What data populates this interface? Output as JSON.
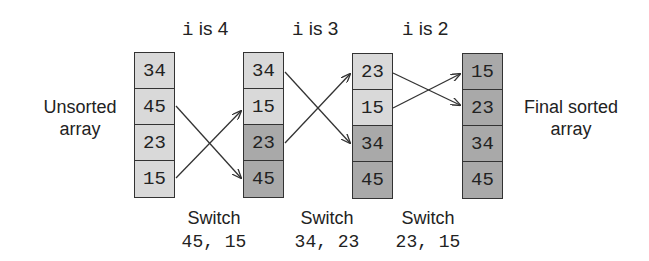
{
  "headers": [
    {
      "var": "i",
      "text": " is 4"
    },
    {
      "var": "i",
      "text": " is 3"
    },
    {
      "var": "i",
      "text": " is 2"
    }
  ],
  "labels": {
    "left_line1": "Unsorted",
    "left_line2": "array",
    "right_line1": "Final sorted",
    "right_line2": "array"
  },
  "columns": [
    {
      "cells": [
        {
          "value": "34",
          "shade": "light"
        },
        {
          "value": "45",
          "shade": "light"
        },
        {
          "value": "23",
          "shade": "light"
        },
        {
          "value": "15",
          "shade": "light"
        }
      ]
    },
    {
      "cells": [
        {
          "value": "34",
          "shade": "light"
        },
        {
          "value": "15",
          "shade": "light"
        },
        {
          "value": "23",
          "shade": "dark"
        },
        {
          "value": "45",
          "shade": "dark"
        }
      ]
    },
    {
      "cells": [
        {
          "value": "23",
          "shade": "light"
        },
        {
          "value": "15",
          "shade": "light"
        },
        {
          "value": "34",
          "shade": "dark"
        },
        {
          "value": "45",
          "shade": "dark"
        }
      ]
    },
    {
      "cells": [
        {
          "value": "15",
          "shade": "dark"
        },
        {
          "value": "23",
          "shade": "dark"
        },
        {
          "value": "34",
          "shade": "dark"
        },
        {
          "value": "45",
          "shade": "dark"
        }
      ]
    }
  ],
  "switches": [
    {
      "label": "Switch",
      "values": "45, 15"
    },
    {
      "label": "Switch",
      "values": "34, 23"
    },
    {
      "label": "Switch",
      "values": "23, 15"
    }
  ],
  "colors": {
    "light_cell": "#d9d9d9",
    "dark_cell": "#a9a9a9",
    "border": "#333333"
  }
}
